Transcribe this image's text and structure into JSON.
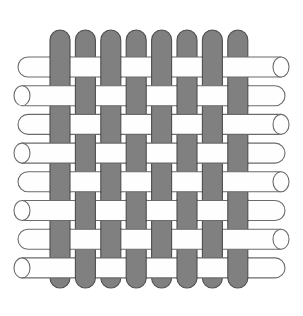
{
  "figure": {
    "name": "plain-weave-diagram",
    "background_color": "#ffffff",
    "width": 303,
    "height": 316
  },
  "colors": {
    "warp_fill": "#808080",
    "warp_stroke": "#4d4d4d",
    "weft_fill": "#fefefe",
    "weft_stroke": "#6b6b6b",
    "weft_cap_fill": "#ffffff",
    "background": "#ffffff"
  },
  "geometry": {
    "warp_count": 8,
    "weft_count": 8,
    "warp_width": 20,
    "warp_pitch": 25.4,
    "warp_first_x": 50,
    "warp_top_y": 30,
    "warp_bottom_y": 288,
    "warp_cap_radius": 10,
    "weft_height": 20,
    "weft_pitch": 28.7,
    "weft_first_y": 57,
    "weft_left_long_x": 18,
    "weft_left_short_x": 22,
    "weft_right_long_x": 285,
    "weft_right_short_x": 281,
    "weft_cap_radius": 10,
    "ellipse_rx": 8,
    "ellipse_ry": 10,
    "stroke_width": 1.1
  },
  "weave": {
    "pattern_name": "plain-weave",
    "repeat": "1/1 over-under",
    "rule": "warp is on top when (column_index + row_index) is even",
    "warp_indices": [
      0,
      1,
      2,
      3,
      4,
      5,
      6,
      7
    ],
    "weft_indices": [
      0,
      1,
      2,
      3,
      4,
      5,
      6,
      7
    ],
    "warp_over_matrix": [
      [
        true,
        false,
        true,
        false,
        true,
        false,
        true,
        false
      ],
      [
        false,
        true,
        false,
        true,
        false,
        true,
        false,
        true
      ],
      [
        true,
        false,
        true,
        false,
        true,
        false,
        true,
        false
      ],
      [
        false,
        true,
        false,
        true,
        false,
        true,
        false,
        true
      ],
      [
        true,
        false,
        true,
        false,
        true,
        false,
        true,
        false
      ],
      [
        false,
        true,
        false,
        true,
        false,
        true,
        false,
        true
      ],
      [
        true,
        false,
        true,
        false,
        true,
        false,
        true,
        false
      ],
      [
        false,
        true,
        false,
        true,
        false,
        true,
        false,
        true
      ]
    ]
  },
  "weft_ends": {
    "left_style_by_row": [
      "round-cap",
      "open-ellipse",
      "round-cap",
      "open-ellipse",
      "round-cap",
      "open-ellipse",
      "round-cap",
      "open-ellipse"
    ],
    "right_style_by_row": [
      "open-ellipse",
      "round-cap",
      "open-ellipse",
      "round-cap",
      "open-ellipse",
      "round-cap",
      "open-ellipse",
      "round-cap"
    ]
  },
  "warp_ends": {
    "top_style": "round-cap",
    "bottom_style": "round-cap"
  }
}
